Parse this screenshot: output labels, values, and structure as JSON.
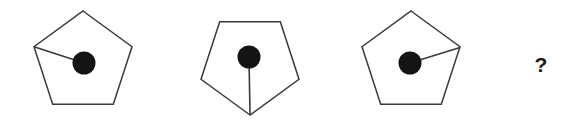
{
  "puzzle": {
    "type": "visual-sequence-analogy",
    "background_color": "#ffffff",
    "stroke_color": "#3a3a3a",
    "dot_color": "#141414",
    "panel_count": 4,
    "question_label": "?"
  },
  "panels": [
    {
      "index": 1,
      "name": "pentagon-panel-1",
      "shape": "pentagon",
      "center": {
        "x": 83,
        "y": 63
      },
      "radius": 52,
      "rotation_deg": 0,
      "orientation": "point-up",
      "dot": {
        "x": 84,
        "y": 63,
        "radius": 11,
        "position": "center"
      },
      "connector": {
        "from": "left-upper-vertex",
        "from_point": {
          "x": 33,
          "y": 51
        },
        "to": "center-dot",
        "to_point": {
          "x": 84,
          "y": 63
        }
      }
    },
    {
      "index": 2,
      "name": "pentagon-panel-2",
      "shape": "pentagon",
      "center": {
        "x": 250,
        "y": 63
      },
      "radius": 52,
      "rotation_deg": 180,
      "orientation": "point-down",
      "dot": {
        "x": 249,
        "y": 57,
        "radius": 11,
        "position": "center"
      },
      "connector": {
        "from": "center-dot",
        "from_point": {
          "x": 249,
          "y": 57
        },
        "to": "bottom-vertex",
        "to_point": {
          "x": 250,
          "y": 114
        }
      }
    },
    {
      "index": 3,
      "name": "pentagon-panel-3",
      "shape": "pentagon",
      "center": {
        "x": 411,
        "y": 63
      },
      "radius": 52,
      "rotation_deg": 0,
      "orientation": "point-up",
      "dot": {
        "x": 410,
        "y": 63,
        "radius": 11,
        "position": "center"
      },
      "connector": {
        "from": "center-dot",
        "from_point": {
          "x": 410,
          "y": 63
        },
        "to": "right-upper-vertex",
        "to_point": {
          "x": 461,
          "y": 51
        }
      }
    },
    {
      "index": 4,
      "name": "answer-panel",
      "shape": "unknown",
      "placeholder": "?",
      "center": {
        "x": 541,
        "y": 65
      }
    }
  ]
}
